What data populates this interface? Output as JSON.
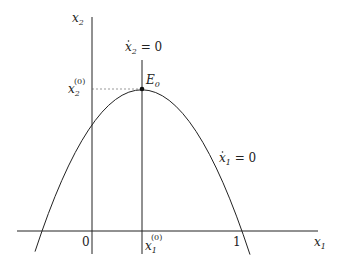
{
  "figure": {
    "axes": {
      "x_label": "x",
      "x_label_sub": "1",
      "y_label": "x",
      "y_label_sub": "2",
      "origin_label": "0",
      "tick_one_label": "1"
    },
    "nullclines": {
      "vertical": {
        "var": "x",
        "sub": "2",
        "text": " = 0"
      },
      "parabola": {
        "var": "x",
        "sub": "1",
        "text": " = 0"
      }
    },
    "equilibrium": {
      "label": "E",
      "label_sub": "0"
    },
    "equilibrium_coords": {
      "x_label": "x",
      "x_sub": "1",
      "x_sup": "(0)",
      "y_label": "x",
      "y_sub": "2",
      "y_sup": "(0)"
    },
    "colors": {
      "line": "#222222",
      "dashed": "#555555"
    }
  }
}
